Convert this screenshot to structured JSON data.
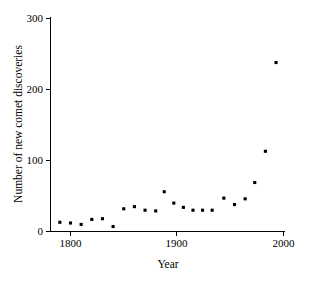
{
  "chart_data": {
    "type": "scatter",
    "title": "",
    "xlabel": "Year",
    "ylabel": "Number of new comet discoveries",
    "xlim": [
      1780,
      2000
    ],
    "ylim": [
      0,
      300
    ],
    "xticks": [
      1800,
      1900,
      2000
    ],
    "xticklabels": [
      "1800",
      "1900",
      "2000"
    ],
    "yticks": [
      0,
      100,
      200,
      300
    ],
    "yticklabels": [
      "0",
      "100",
      "200",
      "300"
    ],
    "grid": false,
    "legend": false,
    "marker": "square",
    "marker_color": "#000000",
    "series": [
      {
        "name": "New comet discoveries",
        "points": [
          {
            "x": 1790,
            "y": 13
          },
          {
            "x": 1800,
            "y": 12
          },
          {
            "x": 1810,
            "y": 10
          },
          {
            "x": 1820,
            "y": 17
          },
          {
            "x": 1830,
            "y": 18
          },
          {
            "x": 1840,
            "y": 7
          },
          {
            "x": 1850,
            "y": 32
          },
          {
            "x": 1860,
            "y": 35
          },
          {
            "x": 1870,
            "y": 30
          },
          {
            "x": 1880,
            "y": 29
          },
          {
            "x": 1888,
            "y": 56
          },
          {
            "x": 1897,
            "y": 40
          },
          {
            "x": 1906,
            "y": 34
          },
          {
            "x": 1915,
            "y": 30
          },
          {
            "x": 1924,
            "y": 30
          },
          {
            "x": 1933,
            "y": 30
          },
          {
            "x": 1944,
            "y": 47
          },
          {
            "x": 1954,
            "y": 38
          },
          {
            "x": 1964,
            "y": 46
          },
          {
            "x": 1973,
            "y": 69
          },
          {
            "x": 1983,
            "y": 113
          },
          {
            "x": 1993,
            "y": 238
          }
        ]
      }
    ]
  },
  "axes": {
    "x_title": "Year",
    "y_title": "Number of new comet discoveries"
  }
}
